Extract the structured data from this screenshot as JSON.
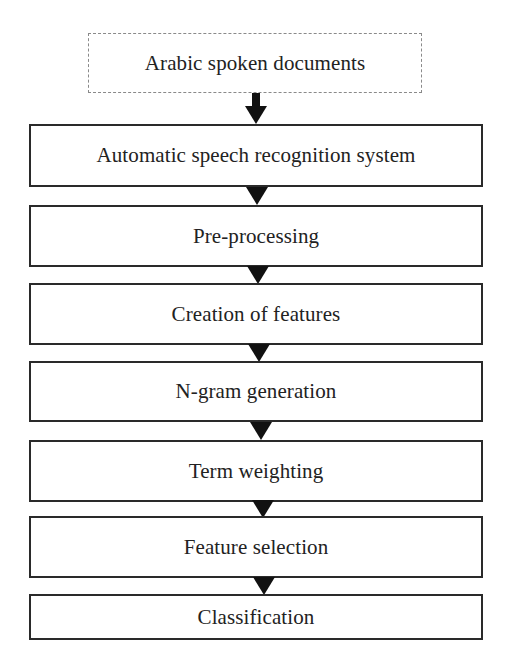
{
  "diagram": {
    "type": "flowchart",
    "direction": "top-to-bottom",
    "input": {
      "label": "Arabic spoken documents",
      "style": "dashed"
    },
    "steps": [
      {
        "label": "Automatic speech recognition system"
      },
      {
        "label": "Pre-processing"
      },
      {
        "label": "Creation of features"
      },
      {
        "label": "N-gram generation"
      },
      {
        "label": "Term weighting"
      },
      {
        "label": "Feature selection"
      },
      {
        "label": "Classification"
      }
    ],
    "colors": {
      "border": "#2a2a2a",
      "dashed_border": "#8a8a8a",
      "arrow": "#111111",
      "text": "#222222",
      "background": "#ffffff"
    }
  }
}
